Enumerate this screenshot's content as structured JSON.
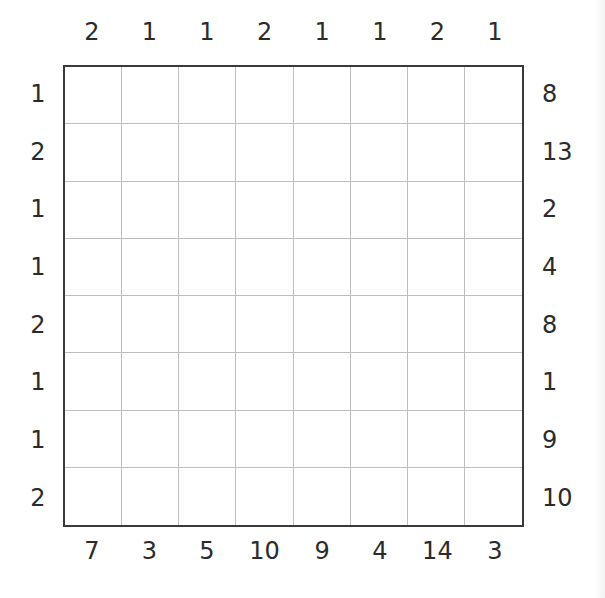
{
  "puzzle": {
    "size": 8,
    "clues": {
      "top": [
        "2",
        "1",
        "1",
        "2",
        "1",
        "1",
        "2",
        "1"
      ],
      "bottom": [
        "7",
        "3",
        "5",
        "10",
        "9",
        "4",
        "14",
        "3"
      ],
      "left": [
        "1",
        "2",
        "1",
        "1",
        "2",
        "1",
        "1",
        "2"
      ],
      "right": [
        "8",
        "13",
        "2",
        "4",
        "8",
        "1",
        "9",
        "10"
      ]
    },
    "cells": [
      [
        "",
        "",
        "",
        "",
        "",
        "",
        "",
        ""
      ],
      [
        "",
        "",
        "",
        "",
        "",
        "",
        "",
        ""
      ],
      [
        "",
        "",
        "",
        "",
        "",
        "",
        "",
        ""
      ],
      [
        "",
        "",
        "",
        "",
        "",
        "",
        "",
        ""
      ],
      [
        "",
        "",
        "",
        "",
        "",
        "",
        "",
        ""
      ],
      [
        "",
        "",
        "",
        "",
        "",
        "",
        "",
        ""
      ],
      [
        "",
        "",
        "",
        "",
        "",
        "",
        "",
        ""
      ],
      [
        "",
        "",
        "",
        "",
        "",
        "",
        "",
        ""
      ]
    ]
  },
  "colors": {
    "text": "#2b2b2b",
    "border": "#3a3a3a",
    "gridline": "#bdbdbd",
    "background": "#ffffff"
  }
}
